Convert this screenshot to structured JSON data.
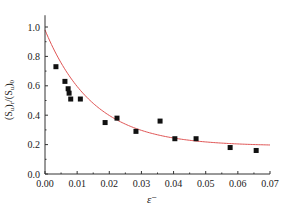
{
  "chart_data": {
    "type": "scatter",
    "title": "",
    "xlabel": "ε⁻",
    "ylabel": "(S_u)_r/(S_u)_0",
    "xlim": [
      0.0,
      0.07
    ],
    "ylim": [
      0.0,
      1.08
    ],
    "grid": false,
    "legend": null,
    "x_ticks": [
      0.0,
      0.01,
      0.02,
      0.03,
      0.04,
      0.05,
      0.06,
      0.07
    ],
    "x_tick_labels": [
      "0.00",
      "0.01",
      "0.02",
      "0.03",
      "0.04",
      "0.05",
      "0.06",
      "0.07"
    ],
    "y_ticks": [
      0.0,
      0.2,
      0.4,
      0.6,
      0.8,
      1.0
    ],
    "y_tick_labels": [
      "0.0",
      "0.2",
      "0.4",
      "0.6",
      "0.8",
      "1.0"
    ],
    "series": [
      {
        "name": "measured",
        "kind": "scatter",
        "marker": "square",
        "color": "#111111",
        "x": [
          0.0034,
          0.0062,
          0.0072,
          0.0075,
          0.008,
          0.011,
          0.0187,
          0.0224,
          0.0283,
          0.0358,
          0.0404,
          0.047,
          0.0576,
          0.0657
        ],
        "y": [
          0.73,
          0.63,
          0.58,
          0.55,
          0.51,
          0.51,
          0.35,
          0.38,
          0.29,
          0.36,
          0.24,
          0.24,
          0.18,
          0.16
        ]
      },
      {
        "name": "fit",
        "kind": "line",
        "color": "#e05555",
        "formula": "y = 0.19 + 0.79*exp(-x/0.015)",
        "params": {
          "a": 0.19,
          "b": 0.79,
          "c": 0.015
        },
        "x_range": [
          0.0,
          0.07
        ]
      }
    ]
  }
}
